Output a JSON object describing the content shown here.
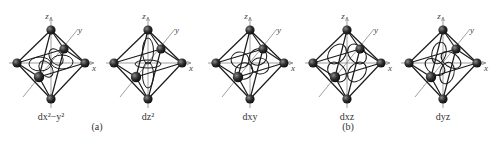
{
  "figure": {
    "octahedra": [
      {
        "id": "dx2-y2",
        "label": "dx²−y²",
        "cx": 51,
        "orbital": "dx2y2"
      },
      {
        "id": "dz2",
        "label": "dz²",
        "cx": 148,
        "orbital": "dz2"
      },
      {
        "id": "dxy",
        "label": "dxy",
        "cx": 250,
        "orbital": "dxy"
      },
      {
        "id": "dxz",
        "label": "dxz",
        "cx": 347,
        "orbital": "dxz"
      },
      {
        "id": "dyz",
        "label": "dyz",
        "cx": 443,
        "orbital": "dyz"
      }
    ],
    "axis_labels": {
      "x": "x",
      "y": "y",
      "z": "z"
    },
    "part_labels": [
      {
        "text": "(a)",
        "x": 97,
        "y": 121
      },
      {
        "text": "(b)",
        "x": 348,
        "y": 121
      }
    ],
    "colors": {
      "line": "#1a1a1a",
      "axis": "#777777",
      "ligand": "#2b2b2b",
      "background": "#ffffff"
    }
  }
}
